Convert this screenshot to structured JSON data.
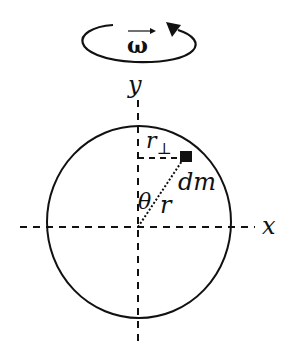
{
  "diagram": {
    "type": "rigid body rotation / moment of inertia",
    "rotation_symbol": "ω",
    "rotation_direction": "counterclockwise",
    "labels": {
      "y_axis": "y",
      "x_axis": "x",
      "r_perp": "r⊥",
      "r_perp_base": "r",
      "r_perp_sub": "⊥",
      "mass_element": "dm",
      "angle": "θ",
      "radius": "r"
    },
    "colors": {
      "stroke": "#111111",
      "background": "#ffffff"
    }
  }
}
